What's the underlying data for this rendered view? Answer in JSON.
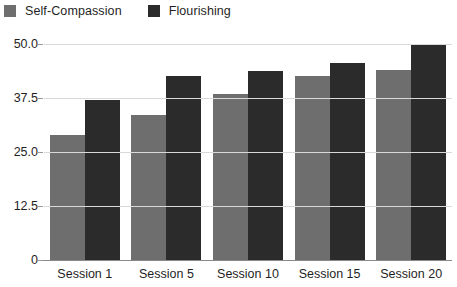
{
  "chart_data": {
    "type": "bar",
    "title": "",
    "subtitle": "",
    "xlabel": "",
    "ylabel": "",
    "categories": [
      "Session 1",
      "Session 5",
      "Session 10",
      "Session 15",
      "Session 20"
    ],
    "series": [
      {
        "name": "Self-Compassion",
        "color": "#6e6e6e",
        "values": [
          29.0,
          33.5,
          38.5,
          42.5,
          44.0
        ]
      },
      {
        "name": "Flourishing",
        "color": "#2b2b2b",
        "values": [
          37.0,
          42.5,
          43.8,
          45.5,
          50.0
        ]
      }
    ],
    "ylim": [
      0,
      50
    ],
    "ytick_labels": [
      "50.0",
      "37.5",
      "25.0",
      "12.5",
      "0"
    ],
    "ytick_values": [
      50,
      37.5,
      25,
      12.5,
      0
    ],
    "grid": true,
    "grid_color": "#d9d9d9",
    "axis_color": "#8a8a8a",
    "legend_position": "top-left",
    "background": "#ffffff"
  },
  "legend": {
    "entries": [
      {
        "label": "Self-Compassion",
        "color": "#6e6e6e"
      },
      {
        "label": "Flourishing",
        "color": "#2b2b2b"
      }
    ]
  }
}
